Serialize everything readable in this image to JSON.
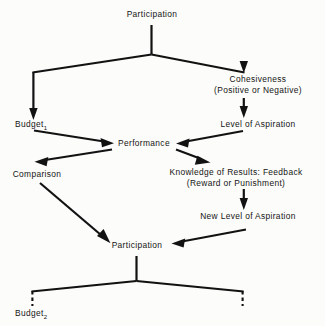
{
  "diagram": {
    "background_color": "#fcfcfa",
    "ink_color": "#121212",
    "nodes": [
      {
        "id": "participation_top",
        "label": "Participation",
        "label2": "",
        "x": 152,
        "y": 14
      },
      {
        "id": "cohesiveness",
        "label": "Cohesiveness",
        "label2": "(Positive or Negative)",
        "x": 258,
        "y": 78
      },
      {
        "id": "budget_1",
        "label": "Budget",
        "subscript": "1",
        "label2": "",
        "x": 31,
        "y": 124
      },
      {
        "id": "level_of_aspiration",
        "label": "Level of Aspiration",
        "label2": "",
        "x": 258,
        "y": 124
      },
      {
        "id": "performance",
        "label": "Performance",
        "label2": "",
        "x": 143,
        "y": 143
      },
      {
        "id": "comparison",
        "label": "Comparison",
        "label2": "",
        "x": 37,
        "y": 174
      },
      {
        "id": "knowledge_of_results",
        "label": "Knowledge of Results: Feedback",
        "label2": "(Reward or Punishment)",
        "x": 236,
        "y": 172
      },
      {
        "id": "new_level_of_aspiration",
        "label": "New Level of Aspiration",
        "label2": "",
        "x": 248,
        "y": 216
      },
      {
        "id": "participation_bottom",
        "label": "Participation",
        "label2": "",
        "x": 137,
        "y": 245
      },
      {
        "id": "budget_2",
        "label": "Budget",
        "subscript": "2",
        "label2": "",
        "x": 31,
        "y": 306
      }
    ],
    "edges": [
      {
        "id": "participation-to-fork",
        "from": "participation_top",
        "to": "fork-top",
        "style": "solid",
        "arrow": false
      },
      {
        "id": "fork-to-budget1",
        "from": "fork-top",
        "to": "budget_1",
        "style": "solid",
        "arrow": true
      },
      {
        "id": "fork-to-cohesiveness",
        "from": "fork-top",
        "to": "cohesiveness",
        "style": "solid",
        "arrow": true
      },
      {
        "id": "cohesiveness-to-level-of-aspiration",
        "from": "cohesiveness",
        "to": "level_of_aspiration",
        "style": "solid",
        "arrow": true
      },
      {
        "id": "budget1-to-performance",
        "from": "budget_1",
        "to": "performance",
        "style": "solid",
        "arrow": true
      },
      {
        "id": "level-of-aspiration-to-performance",
        "from": "level_of_aspiration",
        "to": "performance",
        "style": "solid",
        "arrow": true
      },
      {
        "id": "performance-to-comparison",
        "from": "performance",
        "to": "comparison",
        "style": "solid",
        "arrow": true
      },
      {
        "id": "performance-to-knowledge-of-results",
        "from": "performance",
        "to": "knowledge_of_results",
        "style": "solid",
        "arrow": true
      },
      {
        "id": "knowledge-to-new-level-of-aspiration",
        "from": "knowledge_of_results",
        "to": "new_level_of_aspiration",
        "style": "solid",
        "arrow": true
      },
      {
        "id": "comparison-to-participation",
        "from": "comparison",
        "to": "participation_bottom",
        "style": "solid",
        "arrow": true
      },
      {
        "id": "new-level-to-participation",
        "from": "new_level_of_aspiration",
        "to": "participation_bottom",
        "style": "solid",
        "arrow": true
      },
      {
        "id": "participation-to-fork-bottom",
        "from": "participation_bottom",
        "to": "fork-bottom",
        "style": "solid",
        "arrow": false
      },
      {
        "id": "fork-bottom-to-budget2",
        "from": "fork-bottom",
        "to": "budget_2",
        "style": "dashed",
        "arrow": false
      },
      {
        "id": "fork-bottom-to-continuation",
        "from": "fork-bottom",
        "to": "continuation",
        "style": "dashed",
        "arrow": false
      }
    ]
  }
}
